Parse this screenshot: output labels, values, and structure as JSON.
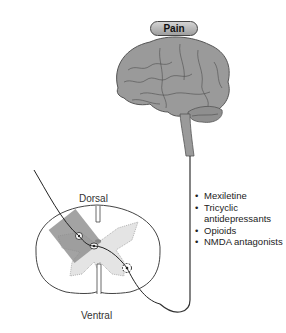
{
  "title_badge": "Pain",
  "spinal_cord": {
    "top_label": "Dorsal",
    "bottom_label": "Ventral"
  },
  "drug_list": [
    "Mexiletine",
    "Tricyclic antidepressants",
    "Opioids",
    "NMDA antagonists"
  ],
  "colors": {
    "brain_fill": "#9a9a9a",
    "badge_fill": "#b8b8b8",
    "gray_matter": "#e4e4e4",
    "dorsal_horn_box": "#8c8c8c"
  }
}
